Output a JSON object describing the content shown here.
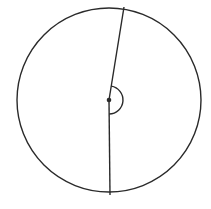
{
  "diagram": {
    "type": "circle-with-central-angle",
    "colors": {
      "stroke": "#2a2a2a",
      "background": "#ffffff"
    },
    "circle": {
      "cx": 109,
      "cy": 100,
      "r": 92
    },
    "center_point": {
      "x": 109,
      "y": 100,
      "r": 2.3
    },
    "radius_top": {
      "x1": 109,
      "y1": 100,
      "x2": 124,
      "y2": 7
    },
    "radius_bottom": {
      "x1": 109,
      "y1": 100,
      "x2": 110,
      "y2": 195
    },
    "angle_arc": {
      "r": 14,
      "side": "right"
    }
  }
}
